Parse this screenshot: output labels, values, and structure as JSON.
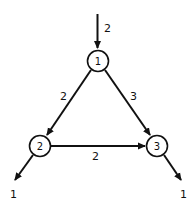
{
  "diagram": {
    "type": "flow-network",
    "colors": {
      "stroke": "#111111",
      "background": "#ffffff"
    },
    "nodes": [
      {
        "id": "1",
        "label": "1"
      },
      {
        "id": "2",
        "label": "2"
      },
      {
        "id": "3",
        "label": "3"
      }
    ],
    "edges": [
      {
        "from": "source",
        "to": "1",
        "label": "2"
      },
      {
        "from": "1",
        "to": "2",
        "label": "2"
      },
      {
        "from": "1",
        "to": "3",
        "label": "3"
      },
      {
        "from": "2",
        "to": "3",
        "label": "2"
      },
      {
        "from": "2",
        "to": "sink",
        "label": "1"
      },
      {
        "from": "3",
        "to": "sink",
        "label": "1"
      }
    ]
  }
}
